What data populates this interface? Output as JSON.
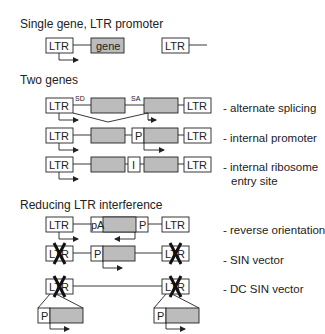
{
  "sections": [
    {
      "title": "Single gene, LTR promoter"
    },
    {
      "title": "Two genes"
    },
    {
      "title": "Reducing LTR interference"
    }
  ],
  "rows": [
    {
      "id": "single",
      "description": ""
    },
    {
      "id": "alt-splicing",
      "description": "- alternate splicing"
    },
    {
      "id": "internal-promoter",
      "description": "- internal promoter"
    },
    {
      "id": "ires",
      "description": "- internal ribosome",
      "description2": "entry site"
    },
    {
      "id": "reverse",
      "description": "- reverse orientation"
    },
    {
      "id": "sin",
      "description": "- SIN vector"
    },
    {
      "id": "dcsin",
      "description": "- DC SIN vector"
    }
  ],
  "labels": {
    "ltr": "LTR",
    "gene": "gene",
    "sd": "SD",
    "sa": "SA",
    "promoter": "P",
    "ires": "I",
    "pa": "pA"
  },
  "colors": {
    "gene_fill": "#bcbcbc",
    "stroke": "#222222",
    "background": "#ffffff"
  }
}
